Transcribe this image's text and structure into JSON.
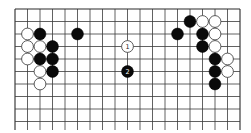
{
  "board": {
    "type": "go-diagram",
    "columns": 19,
    "visible_rows": 10,
    "edges": {
      "top": true,
      "left": true,
      "right": true,
      "bottom": false
    },
    "origin_px": {
      "x": 15,
      "y": 9
    },
    "spacing_px": 12.5,
    "line_extend_bottom_px": 130,
    "colors": {
      "background": "#ffffff",
      "line": "#3a3a3a",
      "black": "#0a0a0a",
      "white": "#ffffff"
    }
  },
  "stones": [
    {
      "color": "white",
      "col": 1,
      "row": 2
    },
    {
      "color": "black",
      "col": 2,
      "row": 2
    },
    {
      "color": "black",
      "col": 5,
      "row": 2
    },
    {
      "color": "white",
      "col": 1,
      "row": 3
    },
    {
      "color": "white",
      "col": 2,
      "row": 3
    },
    {
      "color": "black",
      "col": 3,
      "row": 3
    },
    {
      "color": "white",
      "col": 1,
      "row": 4
    },
    {
      "color": "black",
      "col": 2,
      "row": 4
    },
    {
      "color": "black",
      "col": 3,
      "row": 4
    },
    {
      "color": "white",
      "col": 2,
      "row": 5
    },
    {
      "color": "black",
      "col": 3,
      "row": 5
    },
    {
      "color": "white",
      "col": 2,
      "row": 6
    },
    {
      "color": "white",
      "col": 9,
      "row": 3,
      "label": "1"
    },
    {
      "color": "black",
      "col": 9,
      "row": 5,
      "label": "2"
    },
    {
      "color": "black",
      "col": 14,
      "row": 1
    },
    {
      "color": "white",
      "col": 15,
      "row": 1
    },
    {
      "color": "white",
      "col": 16,
      "row": 1
    },
    {
      "color": "black",
      "col": 13,
      "row": 2
    },
    {
      "color": "black",
      "col": 15,
      "row": 2
    },
    {
      "color": "white",
      "col": 16,
      "row": 2
    },
    {
      "color": "black",
      "col": 15,
      "row": 3
    },
    {
      "color": "white",
      "col": 16,
      "row": 3
    },
    {
      "color": "black",
      "col": 16,
      "row": 4
    },
    {
      "color": "white",
      "col": 17,
      "row": 4
    },
    {
      "color": "black",
      "col": 16,
      "row": 5
    },
    {
      "color": "white",
      "col": 17,
      "row": 5
    },
    {
      "color": "black",
      "col": 16,
      "row": 6
    }
  ],
  "move_labels": [
    {
      "number": "1",
      "stone_color": "white"
    },
    {
      "number": "2",
      "stone_color": "black"
    }
  ]
}
